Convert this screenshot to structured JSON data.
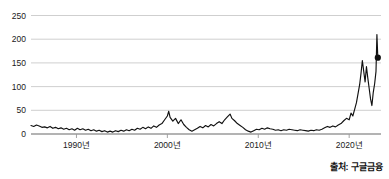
{
  "chart_data": {
    "type": "line",
    "title": "",
    "subtitle": "",
    "xlabel": "",
    "ylabel": "",
    "xlim": [
      1985.0,
      2023.5
    ],
    "ylim": [
      0,
      250
    ],
    "grid": true,
    "legend": null,
    "legend_position": "none",
    "line_color": "#111111",
    "grid_color": "#c9c9c9",
    "axis_color": "#9a9a9a",
    "y_ticks": [
      0,
      50,
      100,
      150,
      200,
      250
    ],
    "y_tick_labels": [
      "0",
      "50",
      "100",
      "150",
      "200",
      "250"
    ],
    "x_ticks": [
      1990,
      2000,
      2010,
      2020
    ],
    "x_tick_labels": [
      "1990년",
      "2000년",
      "2010년",
      "2020년"
    ],
    "end_marker": {
      "x": 2023.15,
      "y": 161,
      "shape": "circle",
      "color": "#111111"
    },
    "annotations": [],
    "series": [
      {
        "name": "주가",
        "color": "#111111",
        "x": [
          1985.0,
          1985.3,
          1985.6,
          1985.9,
          1986.2,
          1986.5,
          1986.8,
          1987.1,
          1987.4,
          1987.7,
          1988.0,
          1988.3,
          1988.6,
          1988.9,
          1989.2,
          1989.5,
          1989.8,
          1990.1,
          1990.4,
          1990.7,
          1991.0,
          1991.3,
          1991.6,
          1991.9,
          1992.2,
          1992.5,
          1992.8,
          1993.1,
          1993.4,
          1993.7,
          1994.0,
          1994.3,
          1994.6,
          1994.9,
          1995.2,
          1995.5,
          1995.8,
          1996.1,
          1996.4,
          1996.7,
          1997.0,
          1997.3,
          1997.6,
          1997.9,
          1998.2,
          1998.5,
          1998.8,
          1999.1,
          1999.4,
          1999.7,
          2000.0,
          2000.15,
          2000.3,
          2000.6,
          2000.9,
          2001.2,
          2001.5,
          2001.8,
          2002.1,
          2002.4,
          2002.7,
          2003.0,
          2003.3,
          2003.6,
          2003.9,
          2004.2,
          2004.5,
          2004.8,
          2005.1,
          2005.4,
          2005.7,
          2006.0,
          2006.3,
          2006.6,
          2006.9,
          2007.1,
          2007.4,
          2007.7,
          2008.0,
          2008.3,
          2008.6,
          2008.9,
          2009.2,
          2009.5,
          2009.8,
          2010.1,
          2010.4,
          2010.7,
          2011.0,
          2011.3,
          2011.6,
          2011.9,
          2012.2,
          2012.5,
          2012.8,
          2013.1,
          2013.4,
          2013.7,
          2014.0,
          2014.3,
          2014.6,
          2014.9,
          2015.2,
          2015.5,
          2015.8,
          2016.1,
          2016.4,
          2016.7,
          2017.0,
          2017.3,
          2017.6,
          2017.9,
          2018.2,
          2018.5,
          2018.8,
          2019.1,
          2019.4,
          2019.7,
          2020.0,
          2020.2,
          2020.4,
          2020.6,
          2020.8,
          2021.0,
          2021.15,
          2021.3,
          2021.45,
          2021.6,
          2021.75,
          2021.9,
          2022.05,
          2022.2,
          2022.35,
          2022.5,
          2022.65,
          2022.8,
          2022.95,
          2023.05,
          2023.15
        ],
        "y": [
          18,
          16,
          19,
          17,
          14,
          15,
          13,
          16,
          12,
          14,
          11,
          13,
          10,
          12,
          9,
          11,
          8,
          12,
          9,
          11,
          8,
          10,
          7,
          9,
          6,
          8,
          5,
          7,
          4,
          6,
          4,
          7,
          5,
          8,
          6,
          9,
          7,
          10,
          8,
          12,
          10,
          14,
          11,
          15,
          12,
          17,
          14,
          19,
          22,
          30,
          38,
          48,
          35,
          27,
          33,
          22,
          30,
          20,
          14,
          9,
          6,
          9,
          12,
          16,
          13,
          18,
          15,
          20,
          17,
          22,
          26,
          22,
          30,
          36,
          42,
          33,
          28,
          22,
          18,
          14,
          9,
          6,
          4,
          7,
          10,
          9,
          12,
          10,
          13,
          11,
          10,
          8,
          9,
          7,
          9,
          8,
          10,
          9,
          8,
          7,
          9,
          8,
          7,
          6,
          8,
          7,
          9,
          8,
          10,
          13,
          16,
          14,
          17,
          15,
          19,
          22,
          28,
          33,
          30,
          44,
          38,
          52,
          66,
          88,
          104,
          128,
          155,
          132,
          110,
          142,
          118,
          96,
          74,
          60,
          88,
          106,
          132,
          210,
          161
        ]
      }
    ]
  },
  "source": {
    "label": "출처: 구글금융"
  }
}
